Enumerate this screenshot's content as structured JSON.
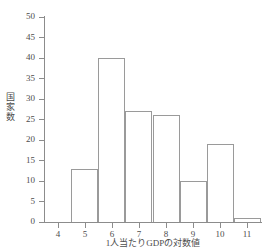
{
  "chart_data": {
    "type": "bar",
    "title": "",
    "subtitle": "",
    "xlabel": "1人当たりGDPの対数値",
    "ylabel": "国家数",
    "xlim": [
      3.5,
      11.5
    ],
    "ylim": [
      0,
      50
    ],
    "grid": false,
    "legend": null,
    "bin_width": 1,
    "bin_edges": [
      4.5,
      5.5,
      6.5,
      7.5,
      8.5,
      9.5,
      10.5,
      11.5
    ],
    "categories": [
      "4.5-5.5",
      "5.5-6.5",
      "6.5-7.5",
      "7.5-8.5",
      "8.5-9.5",
      "9.5-10.5",
      "10.5-11.5"
    ],
    "bin_centers": [
      5,
      6,
      7,
      8,
      9,
      10,
      11
    ],
    "values": [
      13,
      40,
      27,
      26,
      10,
      19,
      1
    ],
    "xticks": [
      4,
      5,
      6,
      7,
      8,
      9,
      10,
      11
    ],
    "xtick_labels": [
      "4",
      "5",
      "6",
      "7",
      "8",
      "9",
      "10",
      "11"
    ],
    "yticks": [
      0,
      5,
      10,
      15,
      20,
      25,
      30,
      35,
      40,
      45,
      50
    ],
    "ytick_labels": [
      "0",
      "5",
      "10",
      "15",
      "20",
      "25",
      "30",
      "35",
      "40",
      "45",
      "50"
    ],
    "bar_fill_color": "#ffffff",
    "bar_edge_color": "#9a9a9a",
    "axis_color": "#8c8c8c",
    "text_color": "#4d4d4d",
    "background_color": "#ffffff"
  }
}
